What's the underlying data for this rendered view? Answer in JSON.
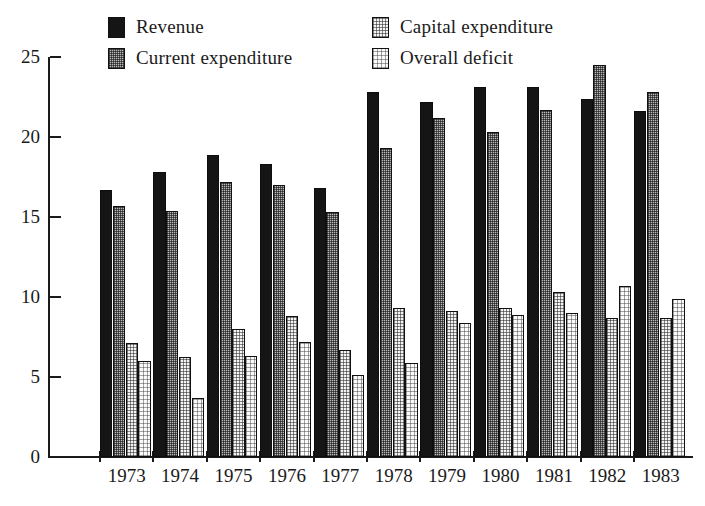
{
  "legend": {
    "items": [
      {
        "label": "Revenue",
        "swatch": "solid-black",
        "fill": "fill-solid",
        "row": 0,
        "col": 0
      },
      {
        "label": "Capital expenditure",
        "swatch": "light-dotted",
        "fill": "fill-light",
        "row": 0,
        "col": 1
      },
      {
        "label": "Current expenditure",
        "swatch": "mid-dotted",
        "fill": "fill-mid",
        "row": 1,
        "col": 0
      },
      {
        "label": "Overall deficit",
        "swatch": "pale-dotted",
        "fill": "fill-pale",
        "row": 1,
        "col": 1
      }
    ]
  },
  "axis": {
    "y_ticks": [
      "0",
      "5",
      "10",
      "15",
      "20",
      "25"
    ],
    "x_ticks": [
      "1973",
      "1974",
      "1975",
      "1976",
      "1977",
      "1978",
      "1979",
      "1980",
      "1981",
      "1982",
      "1983"
    ]
  },
  "colors": {
    "revenue": "#151515",
    "current_expenditure": "#b9b9b9",
    "capital_expenditure": "#f4f4f4",
    "overall_deficit": "#fafafa",
    "axis": "#1a1a1a",
    "background": "#ffffff"
  },
  "chart_data": {
    "type": "bar",
    "title": "",
    "subtitle": "",
    "xlabel": "",
    "ylabel": "",
    "ylim": [
      0,
      25
    ],
    "ytick_step": 5,
    "grid": false,
    "legend_position": "top",
    "categories": [
      "1973",
      "1974",
      "1975",
      "1976",
      "1977",
      "1978",
      "1979",
      "1980",
      "1981",
      "1982",
      "1983"
    ],
    "series": [
      {
        "name": "Revenue",
        "fill": "fill-solid",
        "values": [
          16.7,
          17.8,
          18.9,
          18.3,
          16.8,
          22.8,
          22.2,
          23.1,
          23.1,
          22.4,
          21.6
        ]
      },
      {
        "name": "Current expenditure",
        "fill": "fill-mid",
        "values": [
          15.7,
          15.4,
          17.2,
          17.0,
          15.3,
          19.3,
          21.2,
          20.3,
          21.7,
          24.5,
          22.8
        ]
      },
      {
        "name": "Capital expenditure",
        "fill": "fill-light",
        "values": [
          7.1,
          6.25,
          8.0,
          8.8,
          6.7,
          9.3,
          9.1,
          9.3,
          10.3,
          8.7,
          8.7
        ]
      },
      {
        "name": "Overall deficit",
        "fill": "fill-pale",
        "values": [
          6.0,
          3.7,
          6.3,
          7.2,
          5.1,
          5.9,
          8.4,
          8.9,
          9.0,
          10.7,
          9.9
        ]
      }
    ]
  }
}
